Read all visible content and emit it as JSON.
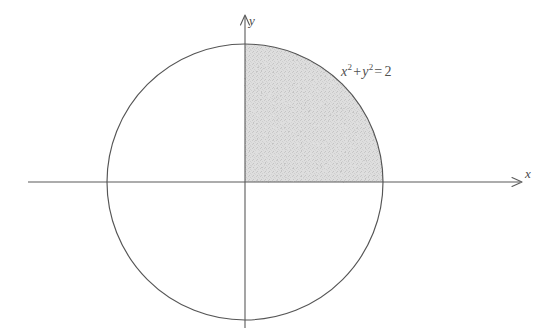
{
  "figure": {
    "type": "math-diagram",
    "background_color": "#ffffff",
    "stroke_color": "#555555",
    "shade_color": "#d9d9d9",
    "axes": {
      "x_label": "x",
      "y_label": "y",
      "x_axis_start_px": 28,
      "x_axis_end_px": 522,
      "y_axis_top_px": 14,
      "y_axis_bottom_px": 328,
      "origin_px": [
        245,
        182
      ],
      "arrowheads": [
        "x-positive",
        "y-positive"
      ]
    },
    "curve": {
      "name": "circle",
      "center_px": [
        245,
        182
      ],
      "radius_px": 138,
      "equation_text_parts": {
        "x_var": "x",
        "x_exp": "2",
        "plus": "+",
        "y_var": "y",
        "y_exp": "2",
        "equals": "=",
        "rhs": "2"
      },
      "equation_plain": "x^2 + y^2 = 2",
      "radius_value": 2,
      "radius_is_squared": true
    },
    "shaded_region": {
      "description": "first-quadrant quarter disk",
      "quadrant": 1,
      "fill": "#d9d9d9"
    }
  }
}
